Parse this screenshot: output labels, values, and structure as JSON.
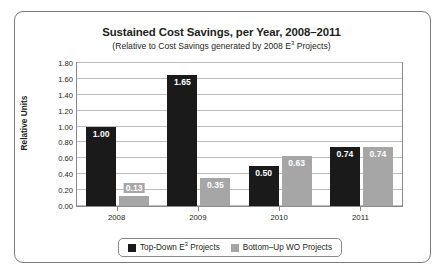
{
  "chart_data": {
    "type": "bar",
    "title": "Sustained Cost Savings, per Year, 2008–2011",
    "subtitle_prefix": "(Relative to Cost Savings generated by 2008 E",
    "subtitle_sup": "3",
    "subtitle_suffix": " Projects)",
    "xlabel": "",
    "ylabel": "Relative Units",
    "categories": [
      "2008",
      "2009",
      "2010",
      "2011"
    ],
    "ylim": [
      0.0,
      1.8
    ],
    "ytick_labels": [
      "0.00",
      "0.20",
      "0.40",
      "0.60",
      "0.80",
      "1.00",
      "1.20",
      "1.40",
      "1.60",
      "1.80"
    ],
    "ytick_values": [
      0.0,
      0.2,
      0.4,
      0.6,
      0.8,
      1.0,
      1.2,
      1.4,
      1.6,
      1.8
    ],
    "grid": true,
    "legend_position": "bottom",
    "series": [
      {
        "name": "Top-Down E3 Projects",
        "label_prefix": "Top-Down E",
        "label_sup": "3",
        "label_suffix": " Projects",
        "color": "#1a1a1a",
        "values": [
          1.0,
          1.65,
          0.5,
          0.74
        ],
        "value_labels": [
          "1.00",
          "1.65",
          "0.50",
          "0.74"
        ]
      },
      {
        "name": "Bottom-Up WO Projects",
        "label_prefix": "Bottom–Up WO Projects",
        "label_sup": "",
        "label_suffix": "",
        "color": "#a6a6a6",
        "values": [
          0.13,
          0.35,
          0.63,
          0.74
        ],
        "value_labels": [
          "0.13",
          "0.35",
          "0.63",
          "0.74"
        ]
      }
    ]
  }
}
